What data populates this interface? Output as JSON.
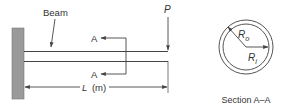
{
  "labels": {
    "beam": "Beam",
    "section_marker_top": "A",
    "section_marker_bottom": "A",
    "load": "P",
    "length_var": "L",
    "length_unit": "(m)",
    "outer_radius_base": "R",
    "outer_radius_sub": "o",
    "inner_radius_base": "R",
    "inner_radius_sub": "i",
    "section_caption": "Section A–A"
  },
  "colors": {
    "line": "#444444",
    "wall_fill": "#9a9a9a",
    "text": "#333333",
    "background": "#ffffff"
  }
}
